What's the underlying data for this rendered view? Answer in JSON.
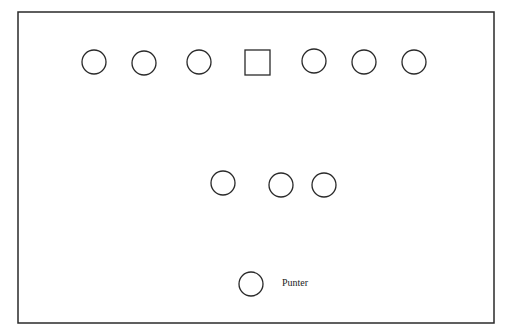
{
  "diagram": {
    "stroke_color": "#2a2a2a",
    "field": {
      "x": 18,
      "y": 12,
      "width": 476,
      "height": 311
    },
    "line": [
      {
        "shape": "circle",
        "cx": 94,
        "cy": 62,
        "r": 12
      },
      {
        "shape": "circle",
        "cx": 144,
        "cy": 63,
        "r": 12
      },
      {
        "shape": "circle",
        "cx": 199,
        "cy": 62,
        "r": 12
      },
      {
        "shape": "square",
        "x": 245,
        "y": 50,
        "size": 25
      },
      {
        "shape": "circle",
        "cx": 314,
        "cy": 61,
        "r": 12
      },
      {
        "shape": "circle",
        "cx": 364,
        "cy": 62,
        "r": 12
      },
      {
        "shape": "circle",
        "cx": 414,
        "cy": 62,
        "r": 12
      }
    ],
    "backs": [
      {
        "shape": "circle",
        "cx": 223,
        "cy": 183,
        "r": 12
      },
      {
        "shape": "circle",
        "cx": 281,
        "cy": 185,
        "r": 12
      },
      {
        "shape": "circle",
        "cx": 324,
        "cy": 185,
        "r": 12
      }
    ],
    "punter": {
      "shape": "circle",
      "cx": 251,
      "cy": 284,
      "r": 12,
      "label": "Punter",
      "label_x": 282,
      "label_y": 277
    }
  }
}
